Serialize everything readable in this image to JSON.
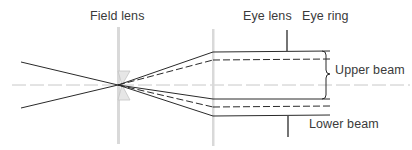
{
  "diagram": {
    "type": "optical-ray-diagram",
    "labels": {
      "field_lens": "Field lens",
      "eye_lens": "Eye lens",
      "eye_ring": "Eye ring",
      "upper_beam": "Upper beam",
      "lower_beam": "Lower beam"
    },
    "colors": {
      "ray": "#2a2a2a",
      "lens": "#d6d6d6",
      "axis": "#c8c8c8",
      "text": "#3a3a3a"
    }
  }
}
